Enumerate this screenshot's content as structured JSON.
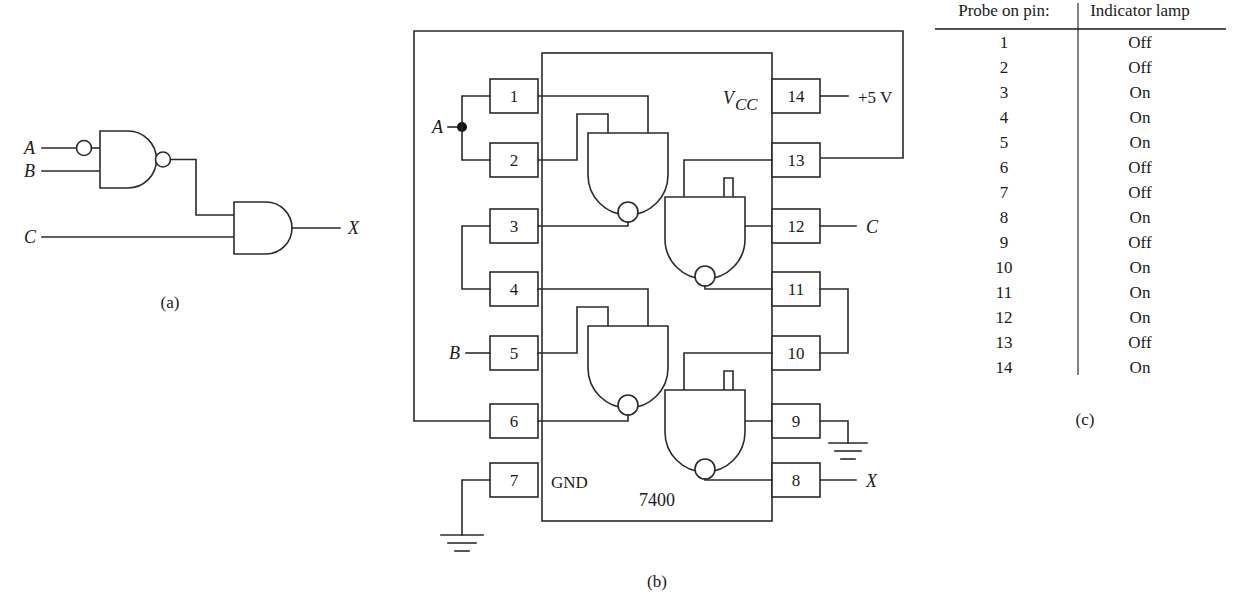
{
  "figure": {
    "panel_a": {
      "caption": "(a)",
      "inputs": [
        {
          "name": "A"
        },
        {
          "name": "B"
        },
        {
          "name": "C"
        }
      ],
      "output": "X",
      "gates": [
        {
          "id": "g1",
          "type": "nand-with-inverted-input",
          "inputs": [
            "A",
            "B"
          ]
        },
        {
          "id": "g2",
          "type": "and",
          "inputs": [
            "g1",
            "C"
          ],
          "output": "X"
        }
      ]
    },
    "panel_b": {
      "caption": "(b)",
      "chip_label": "7400",
      "vcc_label": "V",
      "vcc_sub": "CC",
      "gnd_label": "GND",
      "supply_label": "+5 V",
      "signal_a": "A",
      "signal_b": "B",
      "signal_c": "C",
      "signal_x": "X",
      "pins_left": [
        "1",
        "2",
        "3",
        "4",
        "5",
        "6",
        "7"
      ],
      "pins_right": [
        "14",
        "13",
        "12",
        "11",
        "10",
        "9",
        "8"
      ]
    },
    "panel_c": {
      "caption": "(c)",
      "table": {
        "headers": [
          "Probe on pin:",
          "Indicator lamp"
        ],
        "rows": [
          {
            "pin": "1",
            "lamp": "Off"
          },
          {
            "pin": "2",
            "lamp": "Off"
          },
          {
            "pin": "3",
            "lamp": "On"
          },
          {
            "pin": "4",
            "lamp": "On"
          },
          {
            "pin": "5",
            "lamp": "On"
          },
          {
            "pin": "6",
            "lamp": "Off"
          },
          {
            "pin": "7",
            "lamp": "Off"
          },
          {
            "pin": "8",
            "lamp": "On"
          },
          {
            "pin": "9",
            "lamp": "Off"
          },
          {
            "pin": "10",
            "lamp": "On"
          },
          {
            "pin": "11",
            "lamp": "On"
          },
          {
            "pin": "12",
            "lamp": "On"
          },
          {
            "pin": "13",
            "lamp": "Off"
          },
          {
            "pin": "14",
            "lamp": "On"
          }
        ]
      }
    },
    "colors": {
      "ink": "#1a1a1a",
      "wire": "#2b2b2b",
      "background": "#ffffff"
    }
  }
}
